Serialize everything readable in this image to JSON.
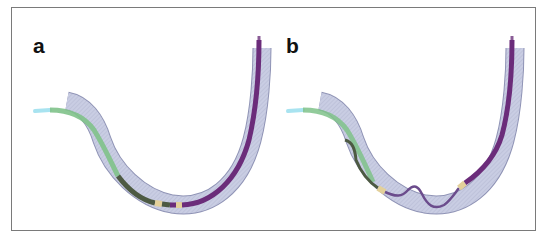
{
  "figure": {
    "panels": [
      {
        "label": "a",
        "description": "Catheter tube in U-shaped vessel, components arranged in series"
      },
      {
        "label": "b",
        "description": "Catheter tube in U-shaped vessel, inner wire buckled/looped"
      }
    ],
    "colors": {
      "vessel_fill": "#c9cde3",
      "vessel_stroke": "#8f93b5",
      "sheath_green": "#7fc28a",
      "tip_cyan": "#a8e3f0",
      "dark_segment": "#4d5a43",
      "purple_segment": "#6b2c7a",
      "marker_tan": "#e3d09a",
      "frame_border": "#7a7a7a"
    }
  }
}
